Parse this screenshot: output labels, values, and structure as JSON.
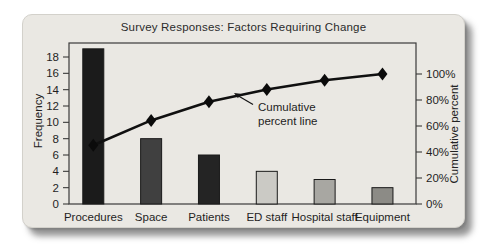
{
  "card": {
    "bg_color": "#eae8e3",
    "shadow_color": "#5a5a5a"
  },
  "chart_data": {
    "type": "bar",
    "subtype": "pareto (bars + cumulative line)",
    "title": "Survey Responses: Factors Requiring Change",
    "categories": [
      "Procedures",
      "Space",
      "Patients",
      "ED staff",
      "Hospital staff",
      "Equipment"
    ],
    "series": [
      {
        "name": "Frequency",
        "type": "bar",
        "values": [
          19,
          8,
          6,
          4,
          3,
          2
        ],
        "colors": [
          "#1b1b1b",
          "#404040",
          "#242424",
          "#cbcac5",
          "#a8a7a2",
          "#8c8b86"
        ]
      },
      {
        "name": "Cumulative percent",
        "type": "line",
        "values_pct": [
          45.2,
          64.3,
          78.6,
          88.1,
          95.2,
          100
        ],
        "color": "#101010",
        "marker": "diamond"
      }
    ],
    "axes": {
      "left": {
        "label": "Frequency",
        "ticks": [
          0,
          2,
          4,
          6,
          8,
          10,
          12,
          14,
          16,
          18
        ],
        "range": [
          0,
          18
        ]
      },
      "right": {
        "label": "Cumulative percent",
        "ticks": [
          "0%",
          "20%",
          "40%",
          "60%",
          "80%",
          "100%"
        ],
        "range_pct": [
          0,
          100
        ]
      }
    },
    "annotation": {
      "lines": [
        "Cumulative",
        "percent line"
      ]
    },
    "grid": false,
    "legend_position": "none"
  }
}
